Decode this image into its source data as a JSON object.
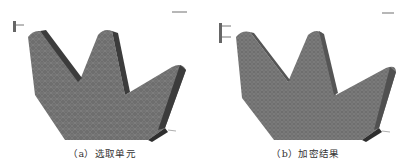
{
  "figure": {
    "panels": [
      {
        "id": "a",
        "caption": "（a）选取单元",
        "content": "gear tooth finite element mesh, selected elements"
      },
      {
        "id": "b",
        "caption": "（b）加密结果",
        "content": "gear tooth finite element mesh, refined result"
      }
    ],
    "colors": {
      "mesh_face": "#6e6e6e",
      "mesh_edge_dark": "#3c3c3c",
      "mesh_lines": "#8a8a8a",
      "background": "#ffffff",
      "caption_text": "#333333"
    }
  }
}
